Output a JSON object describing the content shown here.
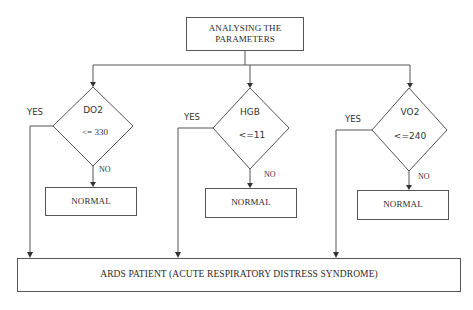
{
  "diagram": {
    "start": {
      "label": "ANALYSING THE PARAMETERS",
      "line1": "ANALYSING THE",
      "line2": "PARAMETERS"
    },
    "decisions": [
      {
        "param": "DO2",
        "condition": "<= 330",
        "yes_label": "YES",
        "no_label": "NO",
        "no_outcome": "NORMAL"
      },
      {
        "param": "HGB",
        "condition": "<=11",
        "yes_label": "YES",
        "no_label": "NO",
        "no_outcome": "NORMAL"
      },
      {
        "param": "VO2",
        "condition": "<=240",
        "yes_label": "YES",
        "no_label": "NO",
        "no_outcome": "NORMAL"
      }
    ],
    "result": {
      "label": "ARDS PATIENT (ACUTE RESPIRATORY DISTRESS SYNDROME)"
    }
  }
}
